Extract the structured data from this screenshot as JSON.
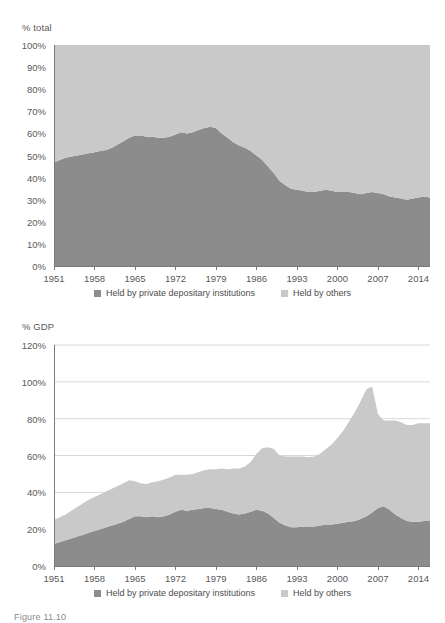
{
  "figure": {
    "caption": "Figure 11.10"
  },
  "colors": {
    "series_private": "#8c8c8c",
    "series_others": "#c9c9c9",
    "axis": "#7a7a7a",
    "grid": "#d9d9d9",
    "tick_text": "#595959"
  },
  "legend": {
    "items": [
      {
        "label": "Held by private depositary institutions",
        "color": "#8c8c8c"
      },
      {
        "label": "Held by others",
        "color": "#c9c9c9"
      }
    ]
  },
  "chart_data": [
    {
      "id": "share-of-total",
      "type": "area",
      "stacked": true,
      "title": "",
      "ylabel": "% total",
      "xlabel": "",
      "ylim": [
        0,
        100
      ],
      "xlim": [
        1951,
        2016
      ],
      "grid": false,
      "legend_position": "bottom",
      "ytick_labels": [
        "0%",
        "10%",
        "20%",
        "30%",
        "40%",
        "50%",
        "60%",
        "70%",
        "80%",
        "90%",
        "100%"
      ],
      "ytick_values": [
        0,
        10,
        20,
        30,
        40,
        50,
        60,
        70,
        80,
        90,
        100
      ],
      "xtick_labels": [
        "1951",
        "1958",
        "1965",
        "1972",
        "1979",
        "1986",
        "1993",
        "2000",
        "2007",
        "2014"
      ],
      "xtick_values": [
        1951,
        1958,
        1965,
        1972,
        1979,
        1986,
        1993,
        2000,
        2007,
        2014
      ],
      "x": [
        1951,
        1952,
        1953,
        1954,
        1955,
        1956,
        1957,
        1958,
        1959,
        1960,
        1961,
        1962,
        1963,
        1964,
        1965,
        1966,
        1967,
        1968,
        1969,
        1970,
        1971,
        1972,
        1973,
        1974,
        1975,
        1976,
        1977,
        1978,
        1979,
        1980,
        1981,
        1982,
        1983,
        1984,
        1985,
        1986,
        1987,
        1988,
        1989,
        1990,
        1991,
        1992,
        1993,
        1994,
        1995,
        1996,
        1997,
        1998,
        1999,
        2000,
        2001,
        2002,
        2003,
        2004,
        2005,
        2006,
        2007,
        2008,
        2009,
        2010,
        2011,
        2012,
        2013,
        2014,
        2015,
        2016
      ],
      "series": [
        {
          "name": "Held by private depositary institutions",
          "color": "#8c8c8c",
          "values": [
            47,
            48,
            49,
            49.5,
            50,
            50.5,
            51,
            51.5,
            52,
            52.5,
            53.5,
            55,
            56.5,
            58,
            59,
            59,
            58.5,
            58.5,
            58,
            58,
            58.5,
            59.5,
            60.5,
            60,
            60.5,
            61.5,
            62.5,
            63,
            62.5,
            60,
            58,
            56,
            54.5,
            53.5,
            52,
            50,
            48,
            45,
            42,
            38.5,
            36.5,
            35,
            34.5,
            34,
            33.5,
            33.5,
            34,
            34.5,
            34,
            33.5,
            33.5,
            33.5,
            33,
            32.5,
            33,
            33.5,
            33,
            32.5,
            31.5,
            31,
            30.5,
            30,
            30.5,
            31,
            31.5,
            31
          ]
        },
        {
          "name": "Held by others",
          "color": "#c9c9c9",
          "values": [
            53,
            52,
            51,
            50.5,
            50,
            49.5,
            49,
            48.5,
            48,
            47.5,
            46.5,
            45,
            43.5,
            42,
            41,
            41,
            41.5,
            41.5,
            42,
            42,
            41.5,
            40.5,
            39.5,
            40,
            39.5,
            38.5,
            37.5,
            37,
            37.5,
            40,
            42,
            44,
            45.5,
            46.5,
            48,
            50,
            52,
            55,
            58,
            61.5,
            63.5,
            65,
            65.5,
            66,
            66.5,
            66.5,
            66,
            65.5,
            66,
            66.5,
            66.5,
            66.5,
            67,
            67.5,
            67,
            66.5,
            67,
            67.5,
            68.5,
            69,
            69.5,
            70,
            69.5,
            69,
            68.5,
            69
          ]
        }
      ]
    },
    {
      "id": "share-of-gdp",
      "type": "area",
      "stacked": true,
      "title": "",
      "ylabel": "% GDP",
      "xlabel": "",
      "ylim": [
        0,
        120
      ],
      "xlim": [
        1951,
        2016
      ],
      "grid": true,
      "legend_position": "bottom",
      "ytick_labels": [
        "0%",
        "20%",
        "40%",
        "60%",
        "80%",
        "100%",
        "120%"
      ],
      "ytick_values": [
        0,
        20,
        40,
        60,
        80,
        100,
        120
      ],
      "xtick_labels": [
        "1951",
        "1958",
        "1965",
        "1972",
        "1979",
        "1986",
        "1993",
        "2000",
        "2007",
        "2014"
      ],
      "xtick_values": [
        1951,
        1958,
        1965,
        1972,
        1979,
        1986,
        1993,
        2000,
        2007,
        2014
      ],
      "x": [
        1951,
        1952,
        1953,
        1954,
        1955,
        1956,
        1957,
        1958,
        1959,
        1960,
        1961,
        1962,
        1963,
        1964,
        1965,
        1966,
        1967,
        1968,
        1969,
        1970,
        1971,
        1972,
        1973,
        1974,
        1975,
        1976,
        1977,
        1978,
        1979,
        1980,
        1981,
        1982,
        1983,
        1984,
        1985,
        1986,
        1987,
        1988,
        1989,
        1990,
        1991,
        1992,
        1993,
        1994,
        1995,
        1996,
        1997,
        1998,
        1999,
        2000,
        2001,
        2002,
        2003,
        2004,
        2005,
        2006,
        2007,
        2008,
        2009,
        2010,
        2011,
        2012,
        2013,
        2014,
        2015,
        2016
      ],
      "series": [
        {
          "name": "Held by private depositary institutions",
          "color": "#8c8c8c",
          "values": [
            12,
            13,
            14,
            15,
            16,
            17,
            18,
            19,
            20,
            21,
            22,
            23,
            24,
            25.5,
            27,
            27,
            26.5,
            27,
            26.5,
            27,
            28,
            29.5,
            30.5,
            30,
            30.5,
            31,
            31.5,
            31.5,
            31,
            30.5,
            29.5,
            28.5,
            28,
            28.5,
            29.5,
            30.5,
            30,
            28.5,
            26,
            23.5,
            22,
            21,
            21,
            21.5,
            21.5,
            21.5,
            22,
            22.5,
            22.5,
            23,
            23.5,
            24,
            24.5,
            25.5,
            27,
            29,
            31.5,
            32.5,
            30.5,
            28,
            26,
            24.5,
            24,
            24,
            24.5,
            24.5
          ]
        },
        {
          "name": "Held by others",
          "color": "#c9c9c9",
          "values": [
            13,
            13.5,
            14,
            15,
            16,
            17,
            18,
            18.5,
            19,
            19.5,
            20,
            20.5,
            21,
            21,
            19,
            18,
            18,
            18.5,
            19.5,
            20,
            20,
            20,
            19,
            19.5,
            19.5,
            20,
            20.5,
            21,
            21.5,
            22.5,
            23,
            24.5,
            25,
            25.5,
            27,
            30.5,
            34,
            36,
            37.5,
            36.5,
            37.5,
            38.5,
            38.5,
            38,
            37.5,
            38,
            39,
            41,
            43.5,
            46.5,
            50,
            54.5,
            59,
            64,
            69,
            68.5,
            51,
            46.5,
            48.5,
            51,
            52,
            52,
            52.5,
            53.5,
            53,
            53
          ]
        }
      ]
    }
  ]
}
